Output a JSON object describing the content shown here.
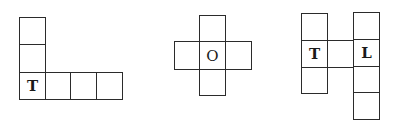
{
  "figures": [
    {
      "name": "net-1-L-shape",
      "cells": [
        {
          "x": 19,
          "y": 17,
          "w": 27,
          "h": 28,
          "label": ""
        },
        {
          "x": 19,
          "y": 44,
          "w": 27,
          "h": 29,
          "label": ""
        },
        {
          "x": 19,
          "y": 72,
          "w": 27,
          "h": 28,
          "label": "T"
        },
        {
          "x": 45,
          "y": 72,
          "w": 26,
          "h": 28,
          "label": ""
        },
        {
          "x": 70,
          "y": 72,
          "w": 27,
          "h": 28,
          "label": ""
        },
        {
          "x": 96,
          "y": 72,
          "w": 27,
          "h": 28,
          "label": ""
        }
      ]
    },
    {
      "name": "net-2-cross",
      "cells": [
        {
          "x": 199,
          "y": 15,
          "w": 27,
          "h": 27,
          "label": ""
        },
        {
          "x": 174,
          "y": 41,
          "w": 26,
          "h": 29,
          "label": ""
        },
        {
          "x": 199,
          "y": 41,
          "w": 27,
          "h": 29,
          "label": "O"
        },
        {
          "x": 225,
          "y": 41,
          "w": 27,
          "h": 29,
          "label": ""
        },
        {
          "x": 199,
          "y": 69,
          "w": 27,
          "h": 27,
          "label": ""
        }
      ]
    },
    {
      "name": "net-3-H-shape",
      "cells": [
        {
          "x": 301,
          "y": 13,
          "w": 27,
          "h": 28,
          "label": ""
        },
        {
          "x": 301,
          "y": 40,
          "w": 27,
          "h": 28,
          "label": "T"
        },
        {
          "x": 301,
          "y": 67,
          "w": 27,
          "h": 27,
          "label": ""
        },
        {
          "x": 327,
          "y": 40,
          "w": 27,
          "h": 28,
          "label": ""
        },
        {
          "x": 353,
          "y": 12,
          "w": 27,
          "h": 28,
          "label": ""
        },
        {
          "x": 353,
          "y": 39,
          "w": 27,
          "h": 28,
          "label": "L"
        },
        {
          "x": 353,
          "y": 66,
          "w": 27,
          "h": 27,
          "label": ""
        },
        {
          "x": 353,
          "y": 92,
          "w": 27,
          "h": 28,
          "label": ""
        }
      ]
    }
  ],
  "labels": {
    "net1_face_T": "T",
    "net2_face_O": "O",
    "net3_face_T": "T",
    "net3_face_L": "L"
  }
}
